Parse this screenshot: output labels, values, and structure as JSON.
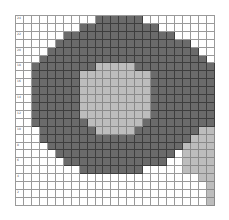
{
  "grid": {
    "columns": 25,
    "rows": 24,
    "colors": {
      "dark": "#6b6b6b",
      "light": "#bdbdbd",
      "white": "#ffffff",
      "gridline": "#9a9a9a"
    },
    "row_labels": [
      "24",
      "",
      "22",
      "",
      "20",
      "",
      "18",
      "",
      "16",
      "",
      "14",
      "",
      "12",
      "",
      "10",
      "",
      "8",
      "",
      "6",
      "",
      "4",
      "",
      "2",
      ""
    ],
    "cells": [
      "..........DDDDDD.........",
      "........DDDDDDDDDD.......",
      "......DDDDDDDDDDDDDD.....",
      ".....DDDDDDDDDDDDDDDDD...",
      "....DDDDDDDDDDDDDDDDDDD..",
      "...DDDDDDDDDDDDDDDDDDDDD.",
      "..DDDDDDDDLLLLLDDDDDDDDDD",
      "..DDDDDDLLLLLLLLLDDDDDDDD",
      "..DDDDDDLLLLLLLLLDDDDDDDD",
      "..DDDDDDLLLLLLLLLDDDDDDDD",
      "..DDDDDDLLLLLLLLLDDDDDDDD",
      "..DDDDDDLLLLLLLLLDDDDDDDD",
      "..DDDDDDLLLLLLLLLDDDDDDDD",
      "..DDDDDDDLLLLLLLDDDDDDDDD",
      "...DDDDDDDLLLLLDDDDDDDDLL",
      "...DDDDDDDDDDDDDDDDDDDLLL",
      "....DDDDDDDDDDDDDDDDDLLLL",
      ".....DDDDDDDDDDDDDDD.LLLL",
      "......DDDDDDDDDDDDD..LLLL",
      "........DDDDDDDD.....LLLL",
      ".......................LL",
      "........................L",
      "........................L",
      "........................L"
    ]
  }
}
